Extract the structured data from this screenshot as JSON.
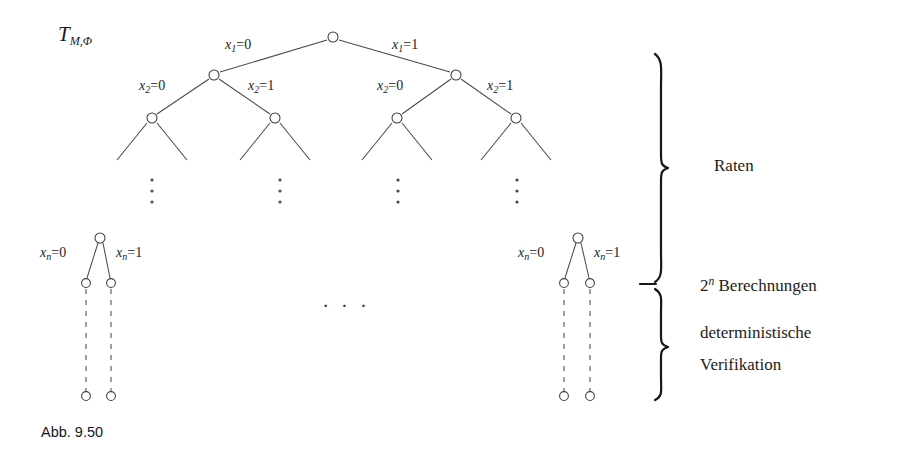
{
  "figure": {
    "tree_title": {
      "base": "T",
      "subscript": "M,Φ"
    },
    "caption": "Abb. 9.50",
    "horizontal_ellipsis": "· · ·",
    "colors": {
      "background": "#ffffff",
      "edge": "#4a4a4a",
      "node_stroke": "#3d3d3d",
      "node_fill": "#ffffff",
      "brace": "#17171b",
      "text": "#1c1c1c"
    },
    "edge_labels": [
      {
        "id": "x1-0",
        "var": "x",
        "sub": "1",
        "op": "=",
        "value": "0",
        "x": 225,
        "y": 45
      },
      {
        "id": "x1-1",
        "var": "x",
        "sub": "1",
        "op": "=",
        "value": "1",
        "x": 392,
        "y": 45
      },
      {
        "id": "x2-0-left",
        "var": "x",
        "sub": "2",
        "op": "=",
        "value": "0",
        "x": 139,
        "y": 86
      },
      {
        "id": "x2-1-left",
        "var": "x",
        "sub": "2",
        "op": "=",
        "value": "1",
        "x": 248,
        "y": 86
      },
      {
        "id": "x2-0-right",
        "var": "x",
        "sub": "2",
        "op": "=",
        "value": "0",
        "x": 377,
        "y": 86
      },
      {
        "id": "x2-1-right",
        "var": "x",
        "sub": "2",
        "op": "=",
        "value": "1",
        "x": 487,
        "y": 86
      },
      {
        "id": "xn-0-left",
        "var": "x",
        "sub": "n",
        "op": "=",
        "value": "0",
        "x": 40,
        "y": 252
      },
      {
        "id": "xn-1-left",
        "var": "x",
        "sub": "n",
        "op": "=",
        "value": "1",
        "x": 116,
        "y": 252
      },
      {
        "id": "xn-0-right",
        "var": "x",
        "sub": "n",
        "op": "=",
        "value": "0",
        "x": 518,
        "y": 252
      },
      {
        "id": "xn-1-right",
        "var": "x",
        "sub": "n",
        "op": "=",
        "value": "1",
        "x": 594,
        "y": 252
      }
    ],
    "side_annotations": [
      {
        "id": "raten",
        "text": "Raten",
        "lines": [
          "Raten"
        ],
        "x": 714,
        "y": 157
      },
      {
        "id": "berechnungen",
        "text": "2ⁿ Berechnungen",
        "prefix": "2",
        "exponent": "n",
        "suffix": " Berechnungen",
        "x": 700,
        "y": 276
      },
      {
        "id": "verifikation",
        "lines": [
          "deterministische",
          "Verifikation"
        ],
        "x": 700,
        "y": 324
      }
    ],
    "vertical_ellipses": [
      {
        "x": 152,
        "y": 186
      },
      {
        "x": 280,
        "y": 186
      },
      {
        "x": 398,
        "y": 186
      },
      {
        "x": 517,
        "y": 186
      }
    ],
    "tree_nodes": {
      "root": {
        "x": 333,
        "y": 37
      },
      "level2": [
        {
          "x": 214,
          "y": 75
        },
        {
          "x": 456,
          "y": 75
        }
      ],
      "level3": [
        {
          "x": 152,
          "y": 118
        },
        {
          "x": 275,
          "y": 118
        },
        {
          "x": 397,
          "y": 118
        },
        {
          "x": 516,
          "y": 118
        }
      ],
      "bottom_left_cluster": {
        "top": {
          "x": 100,
          "y": 238
        },
        "children": [
          {
            "x": 86,
            "y": 283
          },
          {
            "x": 111,
            "y": 283
          }
        ],
        "leaves": [
          {
            "x": 86,
            "y": 396
          },
          {
            "x": 111,
            "y": 396
          }
        ]
      },
      "bottom_right_cluster": {
        "top": {
          "x": 578,
          "y": 238
        },
        "children": [
          {
            "x": 564,
            "y": 283
          },
          {
            "x": 590,
            "y": 283
          }
        ],
        "leaves": [
          {
            "x": 564,
            "y": 396
          },
          {
            "x": 590,
            "y": 396
          }
        ]
      }
    },
    "braces": [
      {
        "id": "raten-brace",
        "top": 53,
        "bottom": 282,
        "x": 660
      },
      {
        "id": "verifikation-brace",
        "top": 288,
        "bottom": 400,
        "x": 660
      }
    ],
    "dash_marker": {
      "x": 645,
      "y": 283,
      "width": 16
    }
  }
}
